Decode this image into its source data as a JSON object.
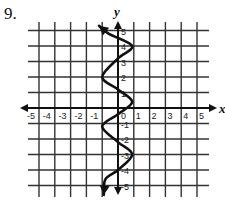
{
  "problem": {
    "number": "9."
  },
  "chart_data": {
    "type": "line",
    "title": "",
    "xlabel": "x",
    "ylabel": "y",
    "xlim": [
      -5,
      5
    ],
    "ylim": [
      -5,
      5
    ],
    "grid": true,
    "x_ticks": [
      "-5",
      "-4",
      "-3",
      "-2",
      "-1",
      "0",
      "1",
      "2",
      "3",
      "4",
      "5"
    ],
    "y_ticks": [
      "5",
      "4",
      "3",
      "2",
      "1",
      "-1",
      "-2",
      "-3",
      "-4",
      "-5"
    ],
    "series": [
      {
        "name": "curve",
        "description": "Sinusoidal curve oscillating horizontally about the y-axis (x as a function of y), with arrows at both ends",
        "points": [
          {
            "x": -1.2,
            "y": 5.3
          },
          {
            "x": -0.6,
            "y": 4.8
          },
          {
            "x": 0.9,
            "y": 4.0
          },
          {
            "x": 0.0,
            "y": 3.2
          },
          {
            "x": -1.0,
            "y": 2.0
          },
          {
            "x": 0.0,
            "y": 1.2
          },
          {
            "x": 0.9,
            "y": 0.4
          },
          {
            "x": 0.0,
            "y": -0.4
          },
          {
            "x": -1.0,
            "y": -1.2
          },
          {
            "x": 0.0,
            "y": -2.2
          },
          {
            "x": 0.9,
            "y": -3.0
          },
          {
            "x": 0.0,
            "y": -4.0
          },
          {
            "x": -0.8,
            "y": -4.6
          },
          {
            "x": -0.9,
            "y": -5.6
          }
        ],
        "color": "#111111"
      }
    ]
  }
}
